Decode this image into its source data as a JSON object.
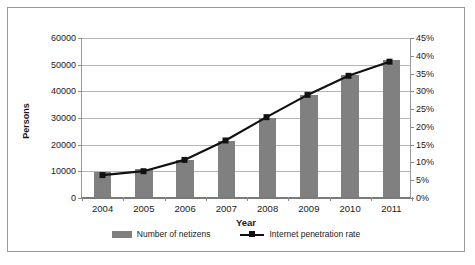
{
  "chart_data": {
    "type": "bar",
    "title": "",
    "xlabel": "Year",
    "ylabel": "Persons",
    "y2label": "",
    "categories": [
      "2004",
      "2005",
      "2006",
      "2007",
      "2008",
      "2009",
      "2010",
      "2011"
    ],
    "ylim": [
      0,
      60000
    ],
    "y2lim": [
      0,
      45
    ],
    "yticks": [
      "0",
      "10000",
      "20000",
      "30000",
      "40000",
      "50000",
      "60000"
    ],
    "ytick_values": [
      0,
      10000,
      20000,
      30000,
      40000,
      50000,
      60000
    ],
    "y2ticks": [
      "0%",
      "5%",
      "10%",
      "15%",
      "20%",
      "25%",
      "30%",
      "35%",
      "40%",
      "45%"
    ],
    "y2tick_values": [
      0,
      5,
      10,
      15,
      20,
      25,
      30,
      35,
      40,
      45
    ],
    "grid": true,
    "legend_position": "bottom",
    "series": [
      {
        "name": "Number of netizens",
        "type": "bar",
        "axis": "left",
        "color": "#808080",
        "values": [
          9400,
          10500,
          13700,
          21000,
          29800,
          38400,
          45700,
          51300
        ]
      },
      {
        "name": "Internet penetration rate",
        "type": "line",
        "axis": "right",
        "color": "#111111",
        "marker": "square",
        "values": [
          6.2,
          7.3,
          10.5,
          16.0,
          22.6,
          28.9,
          34.3,
          38.3
        ]
      }
    ]
  },
  "legend": {
    "items": [
      {
        "label": "Number of netizens",
        "swatch": "bar-swatch"
      },
      {
        "label": "Internet penetration rate",
        "swatch": "line-marker-swatch"
      }
    ]
  },
  "colors": {
    "bar": "#808080",
    "line": "#111111",
    "grid": "#b6b6b6",
    "axis": "#7a7a7a",
    "border": "#9a9a9a",
    "text": "#1a1a1a",
    "background": "#ffffff"
  }
}
